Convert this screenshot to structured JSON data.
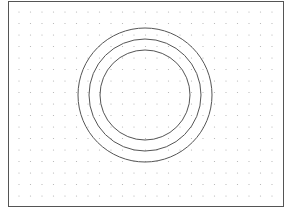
{
  "diagram": {
    "type": "concentric-circles-on-dot-grid",
    "frame": {
      "x": 8,
      "y": 1,
      "width": 275,
      "height": 205,
      "stroke": "#555555"
    },
    "grid": {
      "spacing": 11.5,
      "dot_color": "#b0b0b0",
      "dot_radius": 0.6,
      "origin_x": 19,
      "origin_y": 12
    },
    "circles": [
      {
        "cx": 145,
        "cy": 95,
        "r": 67,
        "stroke": "#555555"
      },
      {
        "cx": 145,
        "cy": 95,
        "r": 56,
        "stroke": "#555555"
      },
      {
        "cx": 145,
        "cy": 95,
        "r": 45,
        "stroke": "#555555"
      }
    ]
  }
}
